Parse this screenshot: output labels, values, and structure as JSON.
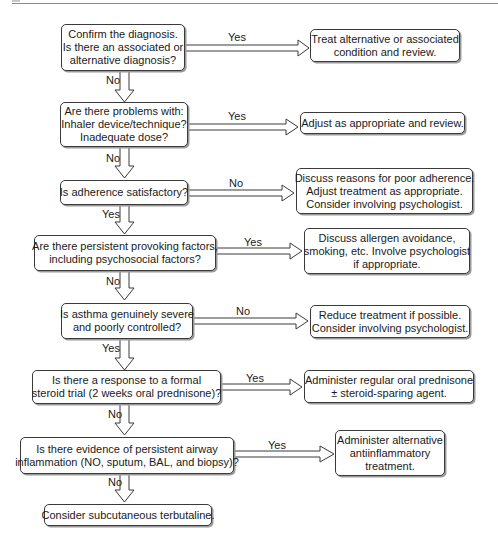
{
  "diagram": {
    "type": "flowchart",
    "decisions": [
      {
        "id": "q1",
        "lines": [
          "Confirm the diagnosis.",
          "Is there an associated or",
          "alternative diagnosis?"
        ],
        "yes_label": "Yes",
        "no_label": "No"
      },
      {
        "id": "q2",
        "lines": [
          "Are there problems with:",
          "Inhaler device/technique?",
          "Inadequate dose?"
        ],
        "yes_label": "Yes",
        "no_label": "No"
      },
      {
        "id": "q3",
        "lines": [
          "Is adherence satisfactory?"
        ],
        "side_label": "No",
        "down_label": "Yes"
      },
      {
        "id": "q4",
        "lines": [
          "Are there persistent provoking factors,",
          "including psychosocial factors?"
        ],
        "yes_label": "Yes",
        "no_label": "No"
      },
      {
        "id": "q5",
        "lines": [
          "Is asthma genuinely severe",
          "and poorly controlled?"
        ],
        "side_label": "No",
        "down_label": "Yes"
      },
      {
        "id": "q6",
        "lines": [
          "Is there a response to a formal",
          "steroid trial (2 weeks oral prednisone)?"
        ],
        "yes_label": "Yes",
        "no_label": "No"
      },
      {
        "id": "q7",
        "lines": [
          "Is there evidence of persistent airway",
          "inflammation (NO, sputum, BAL, and biopsy)?"
        ],
        "yes_label": "Yes",
        "no_label": "No"
      }
    ],
    "actions": [
      {
        "id": "a1",
        "lines": [
          "Treat alternative or associated",
          "condition and review."
        ]
      },
      {
        "id": "a2",
        "lines": [
          "Adjust as appropriate and review."
        ]
      },
      {
        "id": "a3",
        "lines": [
          "Discuss reasons for poor adherence.",
          "Adjust treatment as appropriate.",
          "Consider involving psychologist."
        ]
      },
      {
        "id": "a4",
        "lines": [
          "Discuss allergen avoidance,",
          "smoking, etc. Involve psychologist",
          "if appropriate."
        ]
      },
      {
        "id": "a5",
        "lines": [
          "Reduce treatment if possible.",
          "Consider involving psychologist."
        ]
      },
      {
        "id": "a6",
        "lines": [
          "Administer regular oral prednisone",
          "± steroid-sparing agent."
        ]
      },
      {
        "id": "a7",
        "lines": [
          "Administer alternative",
          "antiinflammatory",
          "treatment."
        ]
      }
    ],
    "terminal": {
      "id": "t1",
      "lines": [
        "Consider subcutaneous terbutaline."
      ]
    }
  }
}
